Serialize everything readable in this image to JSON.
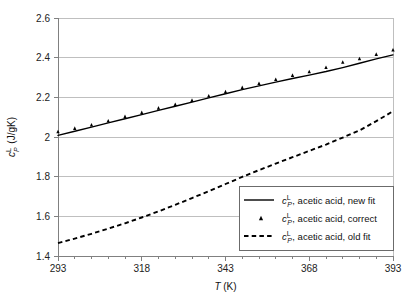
{
  "chart_data": {
    "type": "line",
    "title": "",
    "xlabel": "T (K)",
    "ylabel": "c_P^L (J/gK)",
    "xlabel_parts": {
      "symbol": "T",
      "units": " (K)"
    },
    "ylabel_parts": {
      "symbol": "c",
      "sub": "P",
      "sup": "L",
      "units": " (J/gK)"
    },
    "xlim": [
      293,
      393
    ],
    "ylim": [
      1.4,
      2.6
    ],
    "xticks": [
      293,
      318,
      343,
      368,
      393
    ],
    "xtick_labels": [
      "293",
      "318",
      "343",
      "368",
      "393"
    ],
    "xminor_step": 5,
    "yticks": [
      1.4,
      1.6,
      1.8,
      2.0,
      2.2,
      2.4,
      2.6
    ],
    "ytick_labels": [
      "1.4",
      "1.6",
      "1.8",
      "2",
      "2.2",
      "2.4",
      "2.6"
    ],
    "grid": "horizontal",
    "grid_color": "#bfbfbf",
    "axis_color": "#808080",
    "series_color": "#000000",
    "legend_position": "lower-right",
    "series": [
      {
        "name": "cP_L, acetic acid, new fit",
        "style": "solid",
        "x": [
          293,
          298,
          303,
          308,
          313,
          318,
          323,
          328,
          333,
          338,
          343,
          348,
          353,
          358,
          363,
          368,
          373,
          378,
          383,
          388,
          393
        ],
        "values": [
          2.008,
          2.029,
          2.05,
          2.071,
          2.092,
          2.113,
          2.134,
          2.155,
          2.176,
          2.197,
          2.218,
          2.239,
          2.258,
          2.277,
          2.295,
          2.312,
          2.33,
          2.35,
          2.372,
          2.394,
          2.414
        ]
      },
      {
        "name": "cP_L, acetic acid, correct",
        "style": "markers",
        "marker": "triangle",
        "x": [
          293,
          298,
          303,
          308,
          313,
          318,
          323,
          328,
          333,
          338,
          343,
          348,
          353,
          358,
          363,
          368,
          373,
          378,
          383,
          388,
          393
        ],
        "values": [
          2.028,
          2.045,
          2.062,
          2.082,
          2.104,
          2.124,
          2.147,
          2.165,
          2.186,
          2.208,
          2.229,
          2.25,
          2.271,
          2.291,
          2.312,
          2.33,
          2.352,
          2.378,
          2.396,
          2.418,
          2.44
        ]
      },
      {
        "name": "cP_L, acetic acid, old fit",
        "style": "dashed",
        "x": [
          293,
          298,
          303,
          308,
          313,
          318,
          323,
          328,
          333,
          338,
          343,
          348,
          353,
          358,
          363,
          368,
          373,
          378,
          383,
          388,
          393
        ],
        "values": [
          1.465,
          1.488,
          1.512,
          1.538,
          1.565,
          1.594,
          1.625,
          1.658,
          1.692,
          1.727,
          1.763,
          1.799,
          1.833,
          1.866,
          1.898,
          1.93,
          1.962,
          1.997,
          2.033,
          2.08,
          2.13
        ]
      }
    ]
  },
  "legend": {
    "items": [
      {
        "symbol": "c",
        "sub": "P",
        "sup": "L",
        "text": ", acetic acid, new fit",
        "style": "solid"
      },
      {
        "symbol": "c",
        "sub": "P",
        "sup": "L",
        "text": ", acetic acid, correct",
        "style": "marker"
      },
      {
        "symbol": "c",
        "sub": "P",
        "sup": "L",
        "text": ", acetic acid, old fit",
        "style": "dashed"
      }
    ]
  }
}
